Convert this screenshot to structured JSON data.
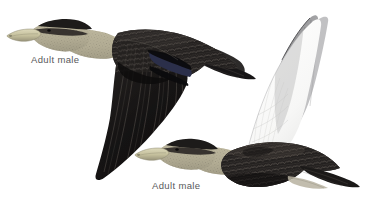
{
  "plate": {
    "width": 373,
    "height": 207,
    "background_color": "#ffffff",
    "rule_color": "#8c8c8e",
    "caption_color": "#58585a",
    "subject": "duck-in-flight-illustration"
  },
  "captions": {
    "upper_bird": "Adult male",
    "lower_bird": "Adult male"
  },
  "figures": [
    {
      "id": "upper-bird",
      "name": "duck-in-flight-upper",
      "pose": "wings-down-left-profile",
      "bill_color": "#b9b48e",
      "head_color": "#b3ad95",
      "body_color": "#231f20",
      "speculum_color": "#2b2f4a"
    },
    {
      "id": "lower-bird",
      "name": "duck-in-flight-lower",
      "pose": "wings-up-left-profile",
      "bill_color": "#c3bd9a",
      "head_color": "#b5af97",
      "body_color": "#2a2626",
      "underwing_color": "#fbfbfb",
      "primaries_color": "#a2a2a4"
    }
  ]
}
